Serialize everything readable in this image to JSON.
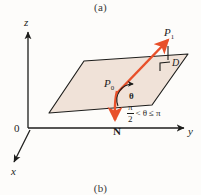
{
  "figure": {
    "caption_top": "(a)",
    "caption_bottom": "(b)",
    "colors": {
      "vector": "#e8502a",
      "plane_fill": "#f0e2d8",
      "axis": "#1d1d1b",
      "background": "#fdfcfa"
    }
  },
  "axes": {
    "z_label": "z",
    "y_label": "y",
    "x_label": "x",
    "origin_label": "0"
  },
  "points": {
    "p0_label": "P",
    "p0_sub": "0",
    "p1_label": "P",
    "p1_sub": "1",
    "normal_label": "N"
  },
  "angle": {
    "symbol": "θ",
    "inequality_num": "π",
    "inequality_den": "2",
    "inequality_rel_left": "<",
    "inequality_var": "θ",
    "inequality_rel_right": "≤",
    "inequality_bound": "π"
  },
  "plane": {
    "label": "D",
    "right_angle_marker": "∟"
  }
}
